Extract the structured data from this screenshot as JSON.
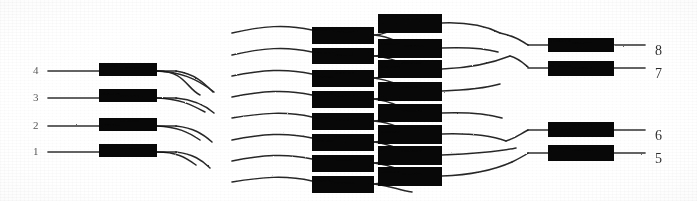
{
  "figure": {
    "type": "network-diagram",
    "ink_color": "#0d0d0d",
    "paper_color": "#fdfdfd",
    "width": 697,
    "height": 201
  },
  "inputs": {
    "label_position": "left",
    "items": [
      {
        "label": "4",
        "label_x": 33,
        "label_y": 74,
        "line_x1": 48,
        "line_x2": 99,
        "y": 71,
        "box_x": 99,
        "box_y": 63,
        "box_w": 58,
        "box_h": 13,
        "out_x1": 157,
        "out_x2": 176
      },
      {
        "label": "3",
        "label_x": 33,
        "label_y": 101,
        "line_x1": 48,
        "line_x2": 99,
        "y": 98,
        "box_x": 99,
        "box_y": 89,
        "box_w": 58,
        "box_h": 13,
        "out_x1": 157,
        "out_x2": 176
      },
      {
        "label": "2",
        "label_x": 33,
        "label_y": 129,
        "line_x1": 48,
        "line_x2": 99,
        "y": 126,
        "box_x": 99,
        "box_y": 118,
        "box_w": 58,
        "box_h": 13,
        "out_x1": 157,
        "out_x2": 176
      },
      {
        "label": "1",
        "label_x": 33,
        "label_y": 155,
        "line_x1": 48,
        "line_x2": 99,
        "y": 152,
        "box_x": 99,
        "box_y": 144,
        "box_w": 58,
        "box_h": 13,
        "out_x1": 157,
        "out_x2": 176
      }
    ]
  },
  "stage_middle_left": {
    "boxes": [
      {
        "x": 312,
        "y": 27,
        "w": 62,
        "h": 17
      },
      {
        "x": 312,
        "y": 48,
        "w": 62,
        "h": 16
      },
      {
        "x": 312,
        "y": 70,
        "w": 62,
        "h": 17
      },
      {
        "x": 312,
        "y": 91,
        "w": 62,
        "h": 17
      },
      {
        "x": 312,
        "y": 113,
        "w": 62,
        "h": 17
      },
      {
        "x": 312,
        "y": 134,
        "w": 62,
        "h": 17
      },
      {
        "x": 312,
        "y": 155,
        "w": 62,
        "h": 17
      },
      {
        "x": 312,
        "y": 176,
        "w": 62,
        "h": 17
      }
    ]
  },
  "stage_middle_right": {
    "boxes": [
      {
        "x": 378,
        "y": 14,
        "w": 64,
        "h": 19
      },
      {
        "x": 378,
        "y": 39,
        "w": 64,
        "h": 19
      },
      {
        "x": 378,
        "y": 60,
        "w": 64,
        "h": 18
      },
      {
        "x": 378,
        "y": 82,
        "w": 64,
        "h": 19
      },
      {
        "x": 378,
        "y": 104,
        "w": 64,
        "h": 18
      },
      {
        "x": 378,
        "y": 125,
        "w": 64,
        "h": 19
      },
      {
        "x": 378,
        "y": 146,
        "w": 64,
        "h": 19
      },
      {
        "x": 378,
        "y": 167,
        "w": 64,
        "h": 19
      }
    ]
  },
  "outputs": {
    "label_position": "right",
    "items": [
      {
        "label": "8",
        "label_x": 655,
        "label_y": 54,
        "box_x": 548,
        "box_y": 38,
        "box_w": 66,
        "box_h": 14,
        "in_x1": 528,
        "in_x2": 548,
        "line_x1": 614,
        "line_x2": 645,
        "y": 45
      },
      {
        "label": "7",
        "label_x": 655,
        "label_y": 77,
        "box_x": 548,
        "box_y": 61,
        "box_w": 66,
        "box_h": 15,
        "in_x1": 528,
        "in_x2": 548,
        "line_x1": 614,
        "line_x2": 645,
        "y": 68
      },
      {
        "label": "6",
        "label_x": 655,
        "label_y": 139,
        "box_x": 548,
        "box_y": 122,
        "box_w": 66,
        "box_h": 15,
        "in_x1": 528,
        "in_x2": 548,
        "line_x1": 614,
        "line_x2": 645,
        "y": 130
      },
      {
        "label": "5",
        "label_x": 655,
        "label_y": 162,
        "box_x": 548,
        "box_y": 145,
        "box_w": 66,
        "box_h": 16,
        "in_x1": 528,
        "in_x2": 548,
        "line_x1": 614,
        "line_x2": 645,
        "y": 153
      }
    ]
  },
  "links": {
    "input_fan": [
      "M157,71 C185,71 186,88 200,95",
      "M157,71 C180,72 196,78 214,92",
      "M157,98 C180,99 190,104 205,112",
      "M157,126 C178,127 188,132 200,140",
      "M157,152 C176,152 185,157 196,165",
      "M176,71 C196,74 205,84 213,92",
      "M176,98 C196,100 206,106 214,113",
      "M176,126 C194,128 203,134 212,142",
      "M176,152 C193,154 202,160 210,168"
    ],
    "mid_entry": [
      "M232,33 C262,26 286,24 312,30",
      "M232,55 C262,48 286,46 312,52",
      "M232,76 C262,70 286,68 312,74",
      "M232,97 C262,91 286,89 312,95",
      "M232,118 C262,113 286,111 312,117",
      "M232,140 C262,134 286,132 312,138",
      "M232,161 C262,155 286,153 312,159",
      "M232,182 C262,177 286,175 312,181"
    ],
    "mid_cross": [
      "M374,35 C392,34 398,24 412,20",
      "M374,35 C392,36 398,44 412,47",
      "M374,56 C392,55 398,47 412,46",
      "M374,56 C392,57 398,63 412,66",
      "M374,78 C392,77 398,68 412,66",
      "M374,78 C392,80 398,86 412,90",
      "M374,99 C392,98 398,91 412,89",
      "M374,99 C392,101 398,107 412,111",
      "M374,121 C392,120 398,113 412,111",
      "M374,121 C392,122 398,128 412,132",
      "M374,142 C392,141 398,134 412,132",
      "M374,142 C392,144 398,150 412,153",
      "M374,163 C392,162 398,156 412,153",
      "M374,163 C392,165 398,170 412,174",
      "M374,184 C392,183 398,178 412,175",
      "M374,184 C392,186 398,190 412,192"
    ],
    "output_fan": [
      "M442,23 C468,22 486,26 500,33",
      "M442,48 C468,47 484,48 498,52",
      "M442,69 C470,68 490,64 510,56",
      "M442,91 C470,90 486,88 500,84",
      "M442,113 C470,112 488,114 502,118",
      "M442,134 C472,133 492,136 506,141",
      "M442,155 C472,154 496,152 516,148",
      "M442,176 C472,175 494,170 512,162",
      "M500,33 C514,36 520,40 528,45",
      "M510,56 C518,58 522,62 528,67",
      "M506,141 C516,138 520,134 528,130",
      "M512,162 C520,158 524,156 528,153"
    ]
  }
}
